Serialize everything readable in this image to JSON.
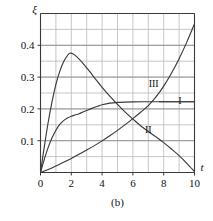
{
  "chart_data": {
    "type": "line",
    "title": "",
    "caption": "(b)",
    "xlabel": "t",
    "ylabel": "ξ",
    "xlim": [
      0,
      10
    ],
    "ylim": [
      0,
      0.5
    ],
    "xticks": [
      0,
      2,
      4,
      6,
      8,
      10
    ],
    "xtick_labels": [
      "0",
      "2",
      "4",
      "6",
      "8",
      "10"
    ],
    "yticks": [
      0.1,
      0.2,
      0.3,
      0.4
    ],
    "ytick_labels": [
      "0.1",
      "0.2",
      "0.3",
      "0.4"
    ],
    "grid": true,
    "grid_x_step": 1,
    "grid_y_step": 0.05,
    "legend_position": "inline-annotations",
    "axis_color": "#3a3a3a",
    "grid_color": "#b9b9b9",
    "curve_color": "#3a3a3a",
    "series": [
      {
        "name": "I",
        "label": "I",
        "label_x": 9.05,
        "label_y": 0.2225,
        "leader_from_x": 7.7,
        "leader_to_x": 10,
        "leader_y": 0.2225,
        "points": [
          [
            0,
            0
          ],
          [
            0.25,
            0.042
          ],
          [
            0.5,
            0.079
          ],
          [
            0.75,
            0.109
          ],
          [
            1,
            0.133
          ],
          [
            1.25,
            0.151
          ],
          [
            1.5,
            0.163
          ],
          [
            1.75,
            0.171
          ],
          [
            2,
            0.177
          ],
          [
            2.25,
            0.181
          ],
          [
            2.5,
            0.185
          ],
          [
            2.75,
            0.19
          ],
          [
            3,
            0.195
          ],
          [
            3.25,
            0.2
          ],
          [
            3.5,
            0.205
          ],
          [
            3.75,
            0.209
          ],
          [
            4,
            0.213
          ],
          [
            4.5,
            0.218
          ],
          [
            5,
            0.2205
          ],
          [
            5.5,
            0.2215
          ],
          [
            6,
            0.222
          ],
          [
            7,
            0.2225
          ],
          [
            8,
            0.2225
          ],
          [
            9,
            0.2225
          ],
          [
            10,
            0.2225
          ]
        ]
      },
      {
        "name": "II",
        "label": "II",
        "label_x": 7.0,
        "label_y": 0.132,
        "peak_x": 1.9,
        "peak_y": 0.375,
        "points": [
          [
            0,
            0
          ],
          [
            0.25,
            0.082
          ],
          [
            0.5,
            0.158
          ],
          [
            0.75,
            0.223
          ],
          [
            1,
            0.277
          ],
          [
            1.25,
            0.318
          ],
          [
            1.5,
            0.348
          ],
          [
            1.75,
            0.368
          ],
          [
            1.9,
            0.375
          ],
          [
            2.1,
            0.3735
          ],
          [
            2.4,
            0.362
          ],
          [
            2.8,
            0.341
          ],
          [
            3.2,
            0.317
          ],
          [
            3.6,
            0.292
          ],
          [
            4,
            0.268
          ],
          [
            4.5,
            0.24
          ],
          [
            5,
            0.214
          ],
          [
            5.5,
            0.19
          ],
          [
            6,
            0.168
          ],
          [
            6.5,
            0.147
          ],
          [
            7,
            0.129
          ],
          [
            7.5,
            0.112
          ],
          [
            8,
            0.094
          ],
          [
            8.5,
            0.074
          ],
          [
            9,
            0.053
          ],
          [
            9.5,
            0.029
          ],
          [
            10,
            0.003
          ]
        ]
      },
      {
        "name": "III",
        "label": "III",
        "label_x": 7.35,
        "label_y": 0.2775,
        "points": [
          [
            0,
            0
          ],
          [
            0.5,
            0.0095
          ],
          [
            1,
            0.0205
          ],
          [
            1.5,
            0.032
          ],
          [
            2,
            0.044
          ],
          [
            2.5,
            0.057
          ],
          [
            3,
            0.0705
          ],
          [
            3.5,
            0.0845
          ],
          [
            4,
            0.0995
          ],
          [
            4.5,
            0.1155
          ],
          [
            5,
            0.1325
          ],
          [
            5.5,
            0.1505
          ],
          [
            6,
            0.1695
          ],
          [
            6.5,
            0.1895
          ],
          [
            7,
            0.2105
          ],
          [
            7.5,
            0.2375
          ],
          [
            8,
            0.2715
          ],
          [
            8.5,
            0.312
          ],
          [
            9,
            0.358
          ],
          [
            9.5,
            0.41
          ],
          [
            10,
            0.4675
          ]
        ]
      }
    ]
  }
}
